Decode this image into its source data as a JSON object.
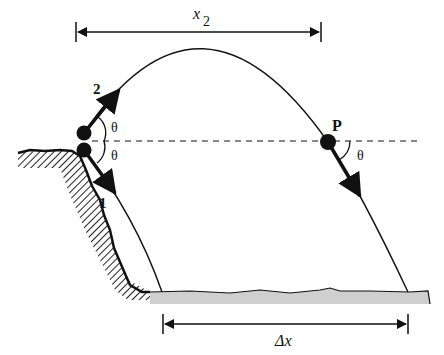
{
  "figure": {
    "labels": {
      "x2_var": "x",
      "x2_sub": "2",
      "delta_x": "Δx",
      "ball2": "2",
      "ball1": "1",
      "point": "P",
      "theta_upper": "θ",
      "theta_lower": "θ",
      "theta_p": "θ"
    },
    "colors": {
      "ink": "#111111",
      "ground_fill": "#cfcfcf",
      "background": "#ffffff"
    }
  }
}
